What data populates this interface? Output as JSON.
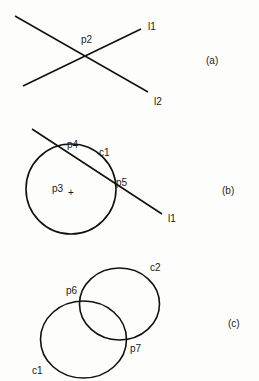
{
  "panels": [
    {
      "id": "a",
      "caption": "(a)",
      "lines": [
        {
          "label": "l1",
          "x1": 23,
          "y1": 86,
          "x2": 141,
          "y2": 29
        },
        {
          "label": "l2",
          "x1": 15,
          "y1": 16,
          "x2": 148,
          "y2": 92
        }
      ],
      "points": [
        {
          "label": "p2"
        }
      ]
    },
    {
      "id": "b",
      "caption": "(b)",
      "circle": {
        "label": "c1",
        "cx": 71,
        "cy": 189,
        "r": 45
      },
      "line": {
        "label": "l1",
        "x1": 32,
        "y1": 129,
        "x2": 162,
        "y2": 214
      },
      "points": [
        {
          "label": "p3",
          "marker": "+"
        },
        {
          "label": "p4"
        },
        {
          "label": "p5"
        }
      ]
    },
    {
      "id": "c",
      "caption": "(c)",
      "ellipses": [
        {
          "label": "c2",
          "cx": 119.5,
          "cy": 304,
          "rx": 40,
          "ry": 36
        },
        {
          "label": "c1",
          "cx": 83.5,
          "cy": 339.5,
          "rx": 43,
          "ry": 38.5
        }
      ],
      "points": [
        {
          "label": "p6"
        },
        {
          "label": "p7"
        }
      ]
    }
  ]
}
